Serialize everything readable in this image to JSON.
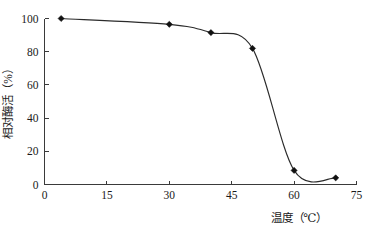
{
  "chart_data": {
    "type": "line",
    "title": "",
    "subtitle": "",
    "xlabel": "温度（℃）",
    "ylabel": "相对酶活（%）",
    "xlim": [
      0,
      75
    ],
    "ylim": [
      0,
      100
    ],
    "xticks": [
      0,
      15,
      30,
      45,
      60,
      75
    ],
    "yticks": [
      0,
      20,
      40,
      60,
      80,
      100
    ],
    "xtick_labels": [
      "0",
      "15",
      "30",
      "45",
      "60",
      "75"
    ],
    "ytick_labels": [
      "0",
      "20",
      "40",
      "60",
      "80",
      "100"
    ],
    "grid": false,
    "legend": false,
    "legend_position": "none",
    "marker": "diamond",
    "line_color": "#2b2b2b",
    "marker_color": "#111111",
    "axis_color": "#3a3a3a",
    "series": [
      {
        "name": "相对酶活",
        "x": [
          4,
          30,
          40,
          50,
          60,
          70
        ],
        "values": [
          100,
          96.5,
          91.5,
          82,
          8.5,
          4
        ]
      }
    ],
    "annotations": []
  }
}
